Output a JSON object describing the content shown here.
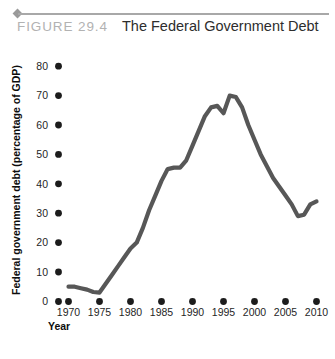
{
  "figure": {
    "number_label": "FIGURE  29.4",
    "title": "The Federal Government Debt",
    "bullet_icon": "diamond-bullet-icon",
    "rule_color": "#a8a8a8",
    "number_color": "#b2b2b2",
    "title_color": "#2d2d2d"
  },
  "chart_data": {
    "type": "line",
    "title": "The Federal Government Debt",
    "xlabel": "Year",
    "ylabel": "Federal government debt (percentage of GDP)",
    "xlim": [
      1968,
      2011
    ],
    "ylim": [
      0,
      84
    ],
    "grid": false,
    "legend": null,
    "line_color": "#575757",
    "origin_label": "0",
    "xticks": [
      1970,
      1975,
      1980,
      1985,
      1990,
      1995,
      2000,
      2005,
      2010
    ],
    "xtick_labels": [
      "1970",
      "1975",
      "1980",
      "1985",
      "1990",
      "1995",
      "2000",
      "2005",
      "2010"
    ],
    "yticks": [
      10,
      20,
      30,
      40,
      50,
      60,
      70,
      80
    ],
    "ytick_labels": [
      "10",
      "20",
      "30",
      "40",
      "50",
      "60",
      "70",
      "80"
    ],
    "series": [
      {
        "name": "Federal government debt",
        "x": [
          1970,
          1971,
          1972,
          1973,
          1974,
          1975,
          1976,
          1977,
          1978,
          1979,
          1980,
          1981,
          1982,
          1983,
          1984,
          1985,
          1986,
          1987,
          1988,
          1989,
          1990,
          1991,
          1992,
          1993,
          1994,
          1995,
          1996,
          1997,
          1998,
          1999,
          2000,
          2001,
          2002,
          2003,
          2004,
          2005,
          2006,
          2007,
          2008,
          2009,
          2010
        ],
        "values": [
          5,
          5,
          4.5,
          4,
          3.2,
          3,
          6,
          9,
          12,
          15,
          18,
          20,
          25,
          31,
          36,
          41,
          45,
          45.5,
          45.5,
          48,
          53,
          58,
          63,
          66,
          66.5,
          64,
          70,
          69.5,
          66,
          60,
          55,
          50,
          46,
          42,
          39,
          36,
          33,
          29,
          29.5,
          33,
          34
        ]
      }
    ]
  }
}
